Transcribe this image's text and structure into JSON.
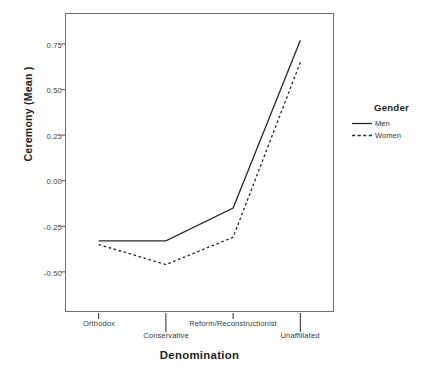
{
  "chart_data": {
    "type": "line",
    "title": "",
    "xlabel": "Denomination",
    "ylabel": "Ceremony (Mean )",
    "categories": [
      "Orthodox",
      "Conservative",
      "Reform/Reconstructionist",
      "Unaffiliated"
    ],
    "series": [
      {
        "name": "Men",
        "values": [
          -0.33,
          -0.33,
          -0.15,
          0.77
        ],
        "style": "solid"
      },
      {
        "name": "Women",
        "values": [
          -0.35,
          -0.46,
          -0.31,
          0.65
        ],
        "style": "dotted"
      }
    ],
    "yticks": [
      "0.75",
      "0.50",
      "0.25",
      "0.00",
      "-0.25",
      "-0.50"
    ],
    "ytick_values": [
      0.75,
      0.5,
      0.25,
      0.0,
      -0.25,
      -0.5
    ],
    "ylim": [
      -0.72,
      0.92
    ],
    "grid": false,
    "legend": {
      "title": "Gender",
      "position": "right"
    },
    "line_color": "#2b2b2b"
  },
  "legend": {
    "title": "Gender",
    "entries": [
      {
        "label": "Men",
        "style": "solid"
      },
      {
        "label": "Women",
        "style": "dotted"
      }
    ]
  },
  "axes": {
    "y_title": "Ceremony (Mean )",
    "x_title": "Denomination",
    "y_ticks": [
      "0.75",
      "0.50",
      "0.25",
      "0.00",
      "-0.25",
      "-0.50"
    ],
    "x_ticks": [
      "Orthodox",
      "Conservative",
      "Reform/Reconstructionist",
      "Unaffiliated"
    ]
  }
}
